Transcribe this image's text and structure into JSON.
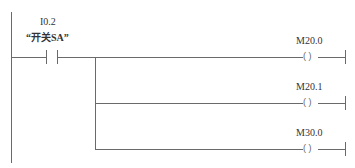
{
  "contact": {
    "address": "I0.2",
    "symbol": "“开关SA”",
    "type": "normally-open-contact"
  },
  "coils": [
    {
      "address": "M20.0",
      "type": "output-coil"
    },
    {
      "address": "M20.1",
      "type": "output-coil"
    },
    {
      "address": "M30.0",
      "type": "output-coil"
    }
  ],
  "coil_glyph": "( )"
}
